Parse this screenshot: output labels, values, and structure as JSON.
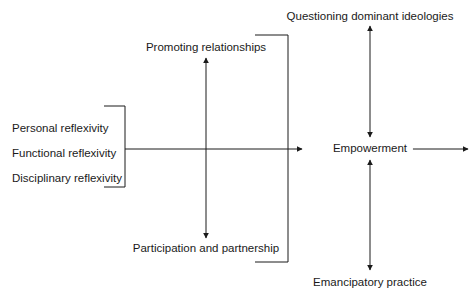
{
  "diagram": {
    "type": "concept-flow-diagram",
    "title": "",
    "canvas": {
      "width": 472,
      "height": 296,
      "background": "#ffffff"
    },
    "stroke_color": "#1a1a1a",
    "text_color": "#1a1a1a",
    "nodes": {
      "personal_reflexivity": {
        "label": "Personal reflexivity",
        "x": 12,
        "y": 123
      },
      "functional_reflexivity": {
        "label": "Functional reflexivity",
        "x": 12,
        "y": 148
      },
      "disciplinary_reflexivity": {
        "label": "Disciplinary reflexivity",
        "x": 12,
        "y": 173
      },
      "promoting_relationships": {
        "label": "Promoting relationships",
        "x": 206,
        "y": 42
      },
      "participation_and_partnership": {
        "label": "Participation and partnership",
        "x": 206,
        "y": 243
      },
      "questioning_dominant_ideologies": {
        "label": "Questioning dominant ideologies",
        "x": 370,
        "y": 11
      },
      "empowerment": {
        "label": "Empowerment",
        "x": 370,
        "y": 146
      },
      "emancipatory_practice": {
        "label": "Emancipatory practice",
        "x": 370,
        "y": 277
      }
    },
    "connectors": [
      {
        "name": "left-brace-group",
        "kind": "bracket",
        "orientation": "right-facing"
      },
      {
        "name": "main-horizontal-axis",
        "kind": "arrow",
        "direction": "right"
      },
      {
        "name": "left-vertical-double-arrow",
        "kind": "arrow",
        "direction": "both"
      },
      {
        "name": "right-brace-group",
        "kind": "bracket",
        "orientation": "left-facing"
      },
      {
        "name": "upper-right-double-arrow",
        "kind": "arrow",
        "direction": "both"
      },
      {
        "name": "lower-right-double-arrow",
        "kind": "arrow",
        "direction": "both"
      },
      {
        "name": "empowerment-outflow-arrow",
        "kind": "arrow",
        "direction": "right"
      }
    ]
  }
}
